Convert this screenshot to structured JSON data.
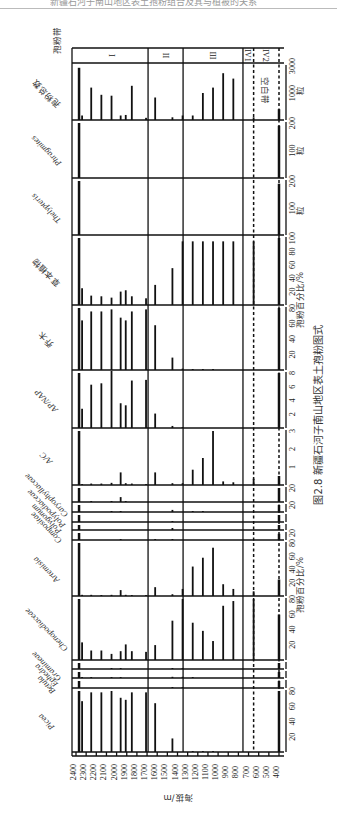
{
  "page": {
    "running_header": "新疆石河子南山地区表土孢粉组合及其与植被的关系"
  },
  "caption": {
    "figure_no": "图2.8",
    "title": "新疆石河子南山地区表土孢粉图式"
  },
  "chart_data": {
    "type": "bar",
    "title": "新疆石河子南山地区表土孢粉图式",
    "orientation": "rotated 90° clockwise on page; elevation axis runs along bottom edge",
    "xlabel": "海拔/m",
    "x_range": [
      2400,
      400
    ],
    "x_ticks": [
      "2400",
      "2300",
      "2200",
      "2100",
      "2000",
      "1900",
      "1800",
      "1700",
      "1600",
      "1500",
      "1400",
      "1300",
      "1200",
      "1100",
      "1000",
      "900",
      "800",
      "700",
      "600",
      "500",
      "400"
    ],
    "samples_elevation_m": [
      2370,
      2340,
      2250,
      2150,
      2050,
      1960,
      1910,
      1850,
      1710,
      1620,
      1450,
      1350,
      1250,
      1150,
      1050,
      950,
      850,
      650,
      400
    ],
    "zones": [
      {
        "label": "I",
        "from": 2400,
        "to": 1690,
        "style": "solid"
      },
      {
        "label": "II",
        "from": 1690,
        "to": 1345,
        "style": "solid"
      },
      {
        "label": "III",
        "from": 1345,
        "to": 755,
        "style": "solid"
      },
      {
        "label": "IV1",
        "from": 755,
        "to": 650,
        "style": "dashed"
      },
      {
        "label": "IV2",
        "from": 650,
        "to": 400,
        "style": "dashed"
      }
    ],
    "zone_column_label": "孢粉带",
    "blank_zone_label": "空白带",
    "group_labels": {
      "percent_a": "孢粉百分比/%",
      "percent_b": "孢粉百分比/%",
      "count_unit": "粒"
    },
    "panels": [
      {
        "key": "total",
        "name": "孢粉总数",
        "name_lang": "cn",
        "unit": "粒",
        "max": 3000,
        "ticks": [
          "1000",
          "3000"
        ],
        "values": [
          2900,
          250,
          1800,
          1400,
          1350,
          250,
          280,
          1900,
          120,
          1250,
          150,
          250,
          250,
          1500,
          1800,
          2600,
          2300,
          150,
          600
        ]
      },
      {
        "key": "phragmites",
        "name": "Phragmites",
        "name_lang": "latin",
        "unit": "粒",
        "max": 200,
        "ticks": [
          "100",
          "200"
        ],
        "values": [
          200,
          0,
          0,
          0,
          0,
          0,
          0,
          0,
          0,
          0,
          0,
          0,
          0,
          0,
          0,
          0,
          0,
          0,
          190
        ]
      },
      {
        "key": "thelypteris",
        "name": "Thelypteris",
        "name_lang": "latin",
        "unit": "粒",
        "max": 200,
        "ticks": [
          "100",
          "200"
        ],
        "values": [
          200,
          0,
          0,
          0,
          0,
          0,
          0,
          0,
          0,
          0,
          0,
          0,
          0,
          0,
          0,
          0,
          0,
          0,
          190
        ]
      },
      {
        "key": "herbs",
        "name": "草本植物",
        "name_lang": "cn",
        "unit": "%",
        "max": 100,
        "ticks": [
          "20",
          "40",
          "60",
          "80",
          "100"
        ],
        "values": [
          100,
          25,
          14,
          13,
          11,
          20,
          22,
          13,
          10,
          30,
          55,
          95,
          95,
          95,
          95,
          95,
          95,
          95,
          100
        ]
      },
      {
        "key": "trees",
        "name": "乔木",
        "name_lang": "cn",
        "unit": "%",
        "max": 90,
        "ticks": [
          "20",
          "40",
          "60",
          "80"
        ],
        "values": [
          90,
          72,
          85,
          85,
          88,
          76,
          72,
          85,
          88,
          65,
          18,
          2,
          1,
          1,
          1,
          0,
          0,
          0,
          90
        ]
      },
      {
        "key": "apnap",
        "name": "AP/NAP",
        "name_lang": "latin",
        "unit": "",
        "max": 8,
        "ticks": [
          "2",
          "4",
          "6",
          "8"
        ],
        "values": [
          8,
          2.8,
          6.3,
          6.5,
          8.3,
          3.6,
          3.3,
          6.9,
          7.0,
          2.1,
          0.3,
          0.1,
          0,
          0,
          0,
          0,
          0,
          0,
          8
        ]
      },
      {
        "key": "ac",
        "name": "A/C",
        "name_lang": "latin",
        "unit": "",
        "max": 3,
        "ticks": [
          "1",
          "2",
          "3"
        ],
        "values": [
          3,
          0.05,
          0.08,
          0.08,
          0.12,
          0.7,
          0.1,
          0.08,
          0.05,
          0.7,
          0.1,
          0.1,
          0.85,
          1.5,
          3.0,
          0.2,
          0.15,
          0.35,
          0.5
        ]
      },
      {
        "key": "caryophyllaceae",
        "name": "Caryophyllaceae",
        "name_lang": "latin",
        "unit": "%",
        "max": 20,
        "ticks": [
          "20"
        ],
        "values": [
          20,
          0,
          0.5,
          0,
          1,
          7,
          0.5,
          0,
          0,
          0,
          0,
          0,
          0,
          0,
          0,
          0,
          0,
          0,
          20
        ]
      },
      {
        "key": "polypodiaceae",
        "name": "Polypodiaceae",
        "name_lang": "latin",
        "unit": "%",
        "max": 20,
        "ticks": [
          "20"
        ],
        "values": [
          20,
          0,
          0,
          0,
          1,
          0.5,
          0,
          0,
          0,
          0,
          6,
          0,
          0.5,
          0.5,
          0,
          0,
          0,
          0,
          20
        ]
      },
      {
        "key": "polygonum",
        "name": "Polygonum",
        "name_lang": "latin",
        "unit": "%",
        "max": 10,
        "ticks": [],
        "values": [
          10,
          0,
          0,
          0,
          0,
          0,
          0,
          0,
          0,
          0,
          1,
          0,
          0,
          0,
          0,
          0,
          0,
          0,
          10
        ]
      },
      {
        "key": "compositae",
        "name": "Compositae",
        "name_lang": "latin",
        "unit": "%",
        "max": 10,
        "ticks": [],
        "values": [
          10,
          0,
          0,
          0,
          0,
          0,
          0,
          0,
          0,
          0,
          4,
          0,
          0,
          0,
          0,
          0,
          0,
          0,
          10
        ]
      },
      {
        "key": "compositae_2",
        "name": "",
        "name_lang": "latin",
        "unit": "%",
        "max": 20,
        "ticks": [
          "20"
        ],
        "values": [
          20,
          0,
          0,
          0,
          0,
          0.3,
          0,
          0,
          0,
          0.3,
          0.3,
          0,
          0,
          0,
          0,
          0,
          0,
          0,
          18
        ]
      },
      {
        "key": "artemisia",
        "name": "Artemisia",
        "name_lang": "latin",
        "unit": "%",
        "max": 90,
        "ticks": [
          "20",
          "40",
          "60",
          "80"
        ],
        "values": [
          90,
          2,
          2,
          1,
          2,
          10,
          2,
          1,
          1,
          15,
          3,
          12,
          50,
          65,
          82,
          20,
          12,
          8,
          28
        ]
      },
      {
        "key": "chenopodiaceae",
        "name": "Chenopodiaceae",
        "name_lang": "latin",
        "unit": "%",
        "max": 90,
        "ticks": [
          "20",
          "40",
          "60",
          "80"
        ],
        "values": [
          90,
          26,
          14,
          14,
          9,
          13,
          23,
          13,
          12,
          22,
          58,
          90,
          55,
          43,
          28,
          80,
          87,
          90,
          67
        ]
      },
      {
        "key": "gramineae",
        "name": "Gramineae",
        "name_lang": "latin",
        "unit": "%",
        "max": 10,
        "ticks": [],
        "values": [
          10,
          0,
          0,
          0,
          0.3,
          0.3,
          0,
          0,
          0,
          0,
          1,
          0.3,
          0,
          0,
          0,
          0,
          0,
          0,
          10
        ]
      },
      {
        "key": "ephedra",
        "name": "Ephedra",
        "name_lang": "latin",
        "unit": "%",
        "max": 10,
        "ticks": [],
        "values": [
          10,
          0.3,
          0.3,
          0,
          0.3,
          0.3,
          0,
          0,
          0,
          0,
          2,
          2,
          1,
          0,
          0,
          0,
          0,
          0,
          10
        ]
      },
      {
        "key": "betula",
        "name": "Betula",
        "name_lang": "latin",
        "unit": "%",
        "max": 10,
        "ticks": [],
        "values": [
          10,
          0,
          0,
          0,
          0,
          0,
          0,
          0,
          0,
          0,
          0.3,
          0.3,
          0,
          0,
          0,
          0,
          0,
          0,
          10
        ]
      },
      {
        "key": "picea",
        "name": "Picea",
        "name_lang": "latin",
        "unit": "%",
        "max": 90,
        "ticks": [
          "20",
          "40",
          "60",
          "80"
        ],
        "values": [
          90,
          75,
          88,
          88,
          90,
          80,
          77,
          88,
          88,
          72,
          20,
          0,
          0.5,
          0.5,
          0.5,
          0,
          0,
          0,
          90
        ]
      }
    ]
  }
}
